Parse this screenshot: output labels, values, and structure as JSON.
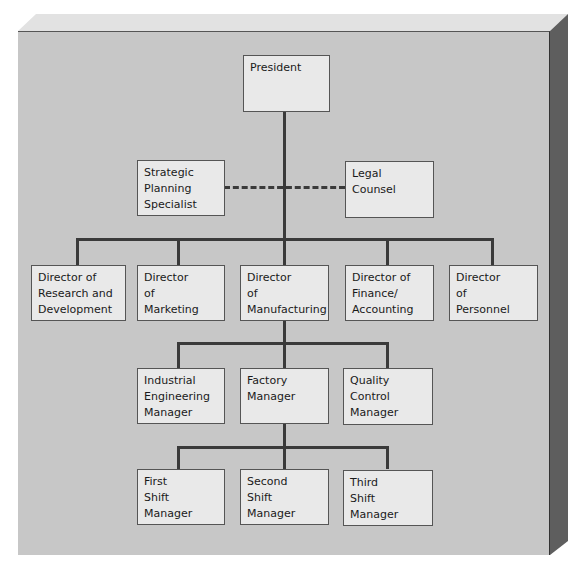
{
  "chart": {
    "type": "org-chart",
    "colors": {
      "board_face": "#c7c7c7",
      "box_fill": "#e9e9e9",
      "connector": "#3a3a3a",
      "board_side": "#5a5a5a",
      "board_top": "#e0e0e0"
    },
    "top": {
      "id": "president",
      "lines": [
        "President"
      ]
    },
    "staff": [
      {
        "id": "strategic-planning-specialist",
        "lines": [
          "Strategic",
          "Planning",
          "Specialist"
        ]
      },
      {
        "id": "legal-counsel",
        "lines": [
          "Legal",
          "Counsel"
        ]
      }
    ],
    "directors": [
      {
        "id": "director-rd",
        "lines": [
          "Director of",
          "Research and",
          "Development"
        ]
      },
      {
        "id": "director-marketing",
        "lines": [
          "Director",
          "of",
          "Marketing"
        ]
      },
      {
        "id": "director-manufacturing",
        "lines": [
          "Director",
          "of",
          "Manufacturing"
        ]
      },
      {
        "id": "director-finance",
        "lines": [
          "Director of",
          "Finance/",
          "Accounting"
        ]
      },
      {
        "id": "director-personnel",
        "lines": [
          "Director",
          "of",
          "Personnel"
        ]
      }
    ],
    "manufacturing_reports": [
      {
        "id": "industrial-engineering-manager",
        "lines": [
          "Industrial",
          "Engineering",
          "Manager"
        ]
      },
      {
        "id": "factory-manager",
        "lines": [
          "Factory",
          "Manager"
        ]
      },
      {
        "id": "quality-control-manager",
        "lines": [
          "Quality",
          "Control",
          "Manager"
        ]
      }
    ],
    "factory_reports": [
      {
        "id": "first-shift-manager",
        "lines": [
          "First",
          "Shift",
          "Manager"
        ]
      },
      {
        "id": "second-shift-manager",
        "lines": [
          "Second",
          "Shift",
          "Manager"
        ]
      },
      {
        "id": "third-shift-manager",
        "lines": [
          "Third",
          "Shift",
          "Manager"
        ]
      }
    ]
  }
}
